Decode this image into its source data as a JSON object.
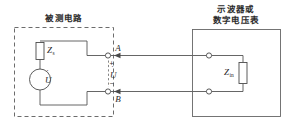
{
  "figure": {
    "type": "circuit-diagram",
    "background_color": "#ffffff",
    "line_color": "#555555"
  },
  "left_block": {
    "title": "被测电路",
    "border_style": "dashed",
    "components": {
      "impedance": {
        "label": "Z",
        "subscript": "s",
        "shape": "rectangle"
      },
      "source": {
        "label": "U",
        "phasor_dot": "˙",
        "shape": "circle"
      }
    }
  },
  "terminals": {
    "top": "A",
    "bottom": "B"
  },
  "measured_voltage": {
    "plus": "+",
    "label": "U",
    "phasor_dot": "˙",
    "minus": "−"
  },
  "right_block": {
    "title_line1": "示波器或",
    "title_line2": "数字电压表",
    "border_style": "solid",
    "components": {
      "input_impedance": {
        "label": "Z",
        "subscript": "in",
        "shape": "rectangle"
      }
    }
  }
}
